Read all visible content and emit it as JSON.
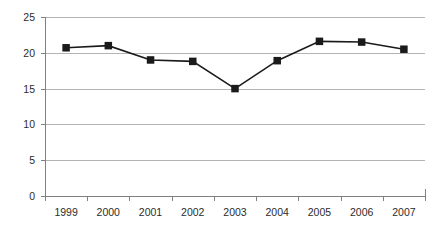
{
  "chart_data": {
    "type": "line",
    "title": "",
    "subtitle": "",
    "xlabel": "",
    "ylabel": "",
    "categories": [
      "1999",
      "2000",
      "2001",
      "2002",
      "2003",
      "2004",
      "2005",
      "2006",
      "2007"
    ],
    "values": [
      20.7,
      21.0,
      19.0,
      18.8,
      15.0,
      18.9,
      21.6,
      21.5,
      20.5
    ],
    "series": [
      {
        "name": "",
        "values": [
          20.7,
          21.0,
          19.0,
          18.8,
          15.0,
          18.9,
          21.6,
          21.5,
          20.5
        ]
      }
    ],
    "ylim": [
      0,
      25
    ],
    "yticks": [
      0,
      5,
      10,
      15,
      20,
      25
    ],
    "ytick_labels": [
      "0",
      "5",
      "10",
      "15",
      "20",
      "25"
    ],
    "grid": true,
    "grid_axis": "y",
    "legend": false,
    "legend_position": "none",
    "marker": "square",
    "marker_color": "#1a1a1a",
    "line_color": "#1a1a1a",
    "gridline_color": "#b4b4b4",
    "axis_color": "#808080",
    "background_color": "#ffffff"
  }
}
